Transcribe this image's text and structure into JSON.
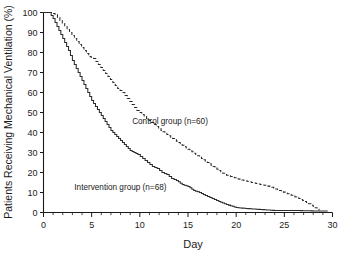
{
  "chart_data": {
    "type": "line",
    "title": "",
    "subtitle": "",
    "xlabel": "Day",
    "ylabel": "Patients Receiving Mechanical Ventilation (%)",
    "xlim": [
      0,
      30
    ],
    "ylim": [
      0,
      100
    ],
    "xticks": [
      0,
      5,
      10,
      15,
      20,
      25,
      30
    ],
    "xticklabels": [
      "0",
      "5",
      "10",
      "15",
      "20",
      "25",
      "30"
    ],
    "xminor_step": 1,
    "yticks": [
      0,
      10,
      20,
      30,
      40,
      50,
      60,
      70,
      80,
      90,
      100
    ],
    "yticklabels": [
      "0",
      "10",
      "20",
      "30",
      "40",
      "50",
      "60",
      "70",
      "80",
      "90",
      "100"
    ],
    "grid": false,
    "legend_position": "inline-annotation",
    "curve_style": "step",
    "series": [
      {
        "name": "Intervention group (n=68)",
        "label": "Intervention group (n=68)",
        "linestyle": "solid",
        "color": "#2b2b2b",
        "n": 68,
        "annotation_x": 3.2,
        "annotation_y": 11.5,
        "x": [
          0,
          0.6,
          1.0,
          1.4,
          1.8,
          2.2,
          2.6,
          3.0,
          3.4,
          3.8,
          4.2,
          4.6,
          5.0,
          5.4,
          5.8,
          6.2,
          6.6,
          7.0,
          7.4,
          7.8,
          8.2,
          8.6,
          9.0,
          9.4,
          9.8,
          10.3,
          10.8,
          11.3,
          11.8,
          12.3,
          12.8,
          13.3,
          13.8,
          14.4,
          15.0,
          15.6,
          16.2,
          16.8,
          17.5,
          18.2,
          19.0,
          20.0,
          21.0,
          22.5,
          24.0,
          26.0,
          28.0,
          29.5
        ],
        "y": [
          100,
          100,
          97,
          93,
          89,
          85,
          81,
          76,
          72,
          68,
          64,
          60,
          56,
          53,
          50,
          47,
          44,
          41,
          39,
          37,
          35,
          33,
          31,
          30,
          29,
          27,
          25,
          23,
          22,
          20,
          19,
          17,
          16,
          14,
          13,
          11,
          10,
          8.5,
          7,
          5.5,
          4,
          2.5,
          2,
          1.5,
          1,
          1,
          0.8,
          0.8
        ]
      },
      {
        "name": "Control group (n=60)",
        "label": "Control group (n=60)",
        "linestyle": "dashed",
        "color": "#2b2b2b",
        "n": 60,
        "annotation_x": 9.2,
        "annotation_y": 44.5,
        "x": [
          0,
          0.7,
          1.2,
          1.7,
          2.2,
          2.7,
          3.2,
          3.7,
          4.2,
          4.7,
          5.2,
          5.7,
          6.2,
          6.7,
          7.2,
          7.7,
          8.2,
          8.7,
          9.2,
          9.7,
          10.2,
          10.7,
          11.2,
          11.7,
          12.2,
          12.8,
          13.4,
          14.0,
          14.6,
          15.2,
          15.8,
          16.4,
          17.0,
          17.6,
          18.2,
          18.8,
          19.4,
          20.0,
          20.8,
          21.6,
          22.5,
          23.5,
          24.5,
          25.5,
          26.5,
          27.3,
          28.0,
          28.6
        ],
        "y": [
          100,
          100,
          99,
          96,
          93,
          90,
          87,
          84,
          81,
          78,
          77,
          74,
          71,
          68,
          65,
          62,
          60,
          57,
          54,
          51,
          49,
          47,
          45,
          43,
          41,
          39,
          37,
          35,
          33,
          31,
          29,
          27,
          25,
          23,
          21,
          19,
          18,
          17,
          16,
          15,
          14,
          13,
          11,
          9,
          7,
          5,
          3,
          1
        ]
      }
    ]
  }
}
